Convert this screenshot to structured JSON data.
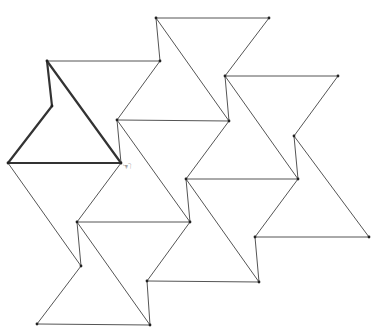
{
  "diagram": {
    "title": "",
    "type": "tessellation",
    "background": "#ffffff",
    "line_color": "#555555",
    "highlight_color": "#333333",
    "vertices": [
      [
        156,
        18
      ],
      [
        269,
        18
      ],
      [
        160,
        61
      ],
      [
        47,
        61
      ],
      [
        225,
        76
      ],
      [
        338,
        76
      ],
      [
        52,
        106
      ],
      [
        117,
        120
      ],
      [
        229,
        121
      ],
      [
        294,
        136
      ],
      [
        8,
        163
      ],
      [
        121,
        163
      ],
      [
        186,
        179
      ],
      [
        298,
        179
      ],
      [
        77,
        222
      ],
      [
        190,
        222
      ],
      [
        255,
        237
      ],
      [
        369,
        237
      ],
      [
        81,
        266
      ],
      [
        147,
        281
      ],
      [
        259,
        282
      ],
      [
        37,
        324
      ],
      [
        150,
        325
      ]
    ],
    "edges": [
      {
        "a": [
          156,
          18
        ],
        "b": [
          269,
          18
        ]
      },
      {
        "a": [
          156,
          18
        ],
        "b": [
          160,
          61
        ]
      },
      {
        "a": [
          156,
          18
        ],
        "b": [
          229,
          121
        ]
      },
      {
        "a": [
          269,
          18
        ],
        "b": [
          225,
          76
        ]
      },
      {
        "a": [
          47,
          61
        ],
        "b": [
          160,
          61
        ]
      },
      {
        "a": [
          160,
          61
        ],
        "b": [
          117,
          120
        ]
      },
      {
        "a": [
          47,
          61
        ],
        "b": [
          52,
          106
        ],
        "bold": true
      },
      {
        "a": [
          47,
          61
        ],
        "b": [
          121,
          163
        ],
        "bold": true
      },
      {
        "a": [
          52,
          106
        ],
        "b": [
          8,
          163
        ],
        "bold": true
      },
      {
        "a": [
          8,
          163
        ],
        "b": [
          121,
          163
        ],
        "bold": true
      },
      {
        "a": [
          225,
          76
        ],
        "b": [
          338,
          76
        ]
      },
      {
        "a": [
          225,
          76
        ],
        "b": [
          229,
          121
        ]
      },
      {
        "a": [
          225,
          76
        ],
        "b": [
          298,
          179
        ]
      },
      {
        "a": [
          338,
          76
        ],
        "b": [
          294,
          136
        ]
      },
      {
        "a": [
          117,
          120
        ],
        "b": [
          229,
          121
        ]
      },
      {
        "a": [
          117,
          120
        ],
        "b": [
          121,
          163
        ]
      },
      {
        "a": [
          117,
          120
        ],
        "b": [
          190,
          222
        ]
      },
      {
        "a": [
          229,
          121
        ],
        "b": [
          186,
          179
        ]
      },
      {
        "a": [
          294,
          136
        ],
        "b": [
          298,
          179
        ]
      },
      {
        "a": [
          294,
          136
        ],
        "b": [
          369,
          237
        ]
      },
      {
        "a": [
          298,
          179
        ],
        "b": [
          255,
          237
        ]
      },
      {
        "a": [
          255,
          237
        ],
        "b": [
          369,
          237
        ]
      },
      {
        "a": [
          186,
          179
        ],
        "b": [
          298,
          179
        ]
      },
      {
        "a": [
          186,
          179
        ],
        "b": [
          190,
          222
        ]
      },
      {
        "a": [
          186,
          179
        ],
        "b": [
          259,
          282
        ]
      },
      {
        "a": [
          190,
          222
        ],
        "b": [
          147,
          281
        ]
      },
      {
        "a": [
          147,
          281
        ],
        "b": [
          259,
          282
        ]
      },
      {
        "a": [
          255,
          237
        ],
        "b": [
          259,
          282
        ]
      },
      {
        "a": [
          121,
          163
        ],
        "b": [
          77,
          222
        ]
      },
      {
        "a": [
          8,
          163
        ],
        "b": [
          81,
          266
        ]
      },
      {
        "a": [
          77,
          222
        ],
        "b": [
          190,
          222
        ]
      },
      {
        "a": [
          77,
          222
        ],
        "b": [
          81,
          266
        ]
      },
      {
        "a": [
          77,
          222
        ],
        "b": [
          150,
          325
        ]
      },
      {
        "a": [
          81,
          266
        ],
        "b": [
          37,
          324
        ]
      },
      {
        "a": [
          37,
          324
        ],
        "b": [
          150,
          325
        ]
      },
      {
        "a": [
          147,
          281
        ],
        "b": [
          150,
          325
        ]
      }
    ],
    "highlighted_tile": [
      [
        47,
        61
      ],
      [
        52,
        106
      ],
      [
        8,
        163
      ],
      [
        121,
        163
      ]
    ],
    "cursor": {
      "icon": "hand-cursor-icon",
      "glyph": "☜",
      "x": 122,
      "y": 161
    }
  }
}
